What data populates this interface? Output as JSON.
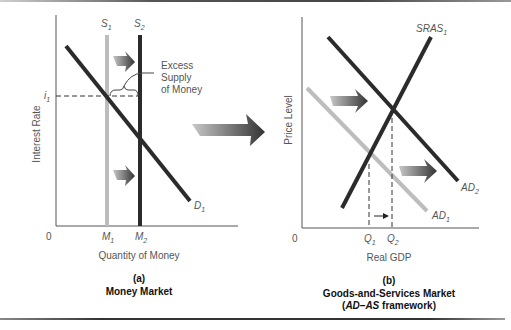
{
  "panel_a": {
    "letter": "(a)",
    "title": "Money Market",
    "y_axis_label": "Interest Rate",
    "x_axis_label": "Quantity of Money",
    "origin": "0",
    "supply_1": {
      "base": "S",
      "sub": "1"
    },
    "supply_2": {
      "base": "S",
      "sub": "2"
    },
    "demand_1": {
      "base": "D",
      "sub": "1"
    },
    "rate_1": {
      "base": "i",
      "sub": "1"
    },
    "quantity_1": {
      "base": "M",
      "sub": "1"
    },
    "quantity_2": {
      "base": "M",
      "sub": "2"
    },
    "annotation": [
      "Excess",
      "Supply",
      "of Money"
    ]
  },
  "panel_b": {
    "letter": "(b)",
    "title": "Goods-and-Services Market",
    "subtitle_italic": "AD–AS",
    "subtitle_rest": " framework)",
    "subtitle_open": "(",
    "y_axis_label": "Price Level",
    "x_axis_label": "Real GDP",
    "origin": "0",
    "sras_1": {
      "base": "SRAS",
      "sub": "1"
    },
    "ad_1": {
      "base": "AD",
      "sub": "1"
    },
    "ad_2": {
      "base": "AD",
      "sub": "2"
    },
    "output_1": {
      "base": "Q",
      "sub": "1"
    },
    "output_2": {
      "base": "Q",
      "sub": "2"
    }
  },
  "colors": {
    "dark_curve": "#2b2b2b",
    "light_curve": "#bdbdbd",
    "axis": "#555555",
    "arrow_dark": "#3a3a3a",
    "arrow_light": "#9a9a9a"
  }
}
